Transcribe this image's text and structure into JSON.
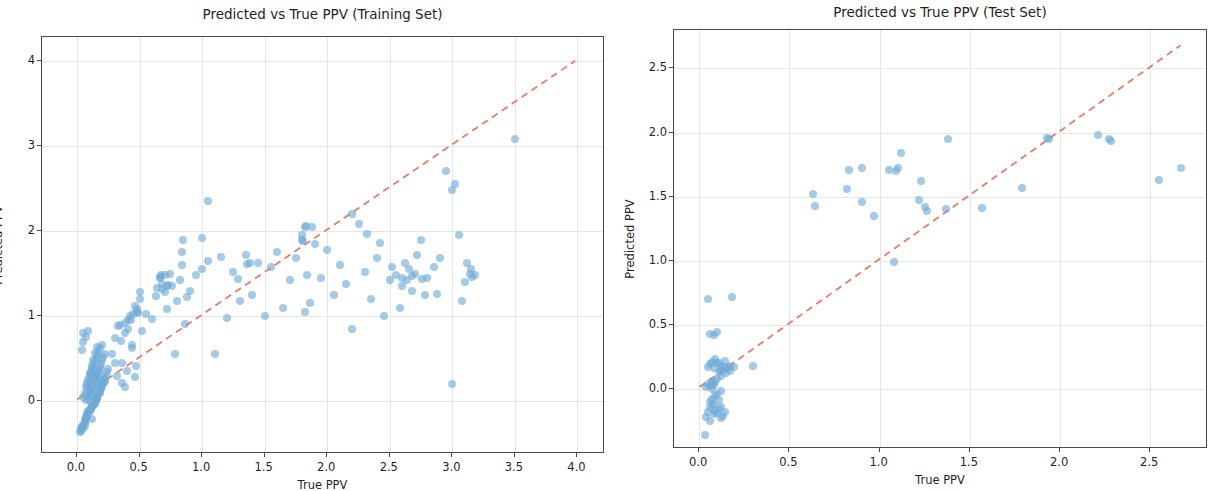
{
  "figure": {
    "background_color": "#ffffff",
    "point_color": "#6ea9d7",
    "point_opacity": 0.62,
    "reference_line_color": "#e8705a",
    "grid_color": "#e4e7ea",
    "axis_color": "#4a4a4a"
  },
  "chart_data": [
    {
      "id": "training",
      "type": "scatter",
      "title": "Predicted vs True PPV (Training Set)",
      "xlabel": "True PPV",
      "ylabel": "Predicted PPV",
      "xlim": [
        -0.28,
        4.22
      ],
      "ylim": [
        -0.62,
        4.28
      ],
      "xticks": [
        0.0,
        0.5,
        1.0,
        1.5,
        2.0,
        2.5,
        3.0,
        3.5,
        4.0
      ],
      "xticklabels": [
        "0.0",
        "0.5",
        "1.0",
        "1.5",
        "2.0",
        "2.5",
        "3.0",
        "3.5",
        "4.0"
      ],
      "yticks": [
        0,
        1,
        2,
        3,
        4
      ],
      "yticklabels": [
        "0",
        "1",
        "2",
        "3",
        "4"
      ],
      "grid": true,
      "legend": null,
      "reference_line": {
        "label": "y = x",
        "from": [
          0.0,
          0.0
        ],
        "to": [
          4.0,
          4.0
        ],
        "style": "dashed",
        "color": "#e8705a"
      },
      "x": [
        0.03,
        0.04,
        0.05,
        0.05,
        0.06,
        0.06,
        0.07,
        0.07,
        0.07,
        0.08,
        0.08,
        0.08,
        0.09,
        0.09,
        0.09,
        0.1,
        0.1,
        0.1,
        0.1,
        0.11,
        0.11,
        0.11,
        0.12,
        0.12,
        0.12,
        0.12,
        0.13,
        0.13,
        0.13,
        0.14,
        0.14,
        0.14,
        0.15,
        0.15,
        0.15,
        0.16,
        0.16,
        0.16,
        0.17,
        0.17,
        0.17,
        0.18,
        0.18,
        0.18,
        0.19,
        0.19,
        0.2,
        0.2,
        0.2,
        0.21,
        0.21,
        0.22,
        0.22,
        0.23,
        0.24,
        0.25,
        0.05,
        0.06,
        0.07,
        0.08,
        0.08,
        0.09,
        0.1,
        0.1,
        0.11,
        0.11,
        0.12,
        0.12,
        0.13,
        0.13,
        0.14,
        0.14,
        0.15,
        0.16,
        0.16,
        0.17,
        0.18,
        0.19,
        0.2,
        0.22,
        0.04,
        0.06,
        0.08,
        0.09,
        0.11,
        0.13,
        0.15,
        0.17,
        0.19,
        0.21,
        0.05,
        0.07,
        0.09,
        0.12,
        0.14,
        0.16,
        0.18,
        0.06,
        0.1,
        0.14,
        0.02,
        0.03,
        0.04,
        0.05,
        0.28,
        0.3,
        0.32,
        0.34,
        0.36,
        0.38,
        0.4,
        0.42,
        0.44,
        0.46,
        0.48,
        0.5,
        0.35,
        0.38,
        0.41,
        0.44,
        0.47,
        0.3,
        0.33,
        0.43,
        0.46,
        0.49,
        0.52,
        0.55,
        0.6,
        0.63,
        0.66,
        0.68,
        0.7,
        0.72,
        0.74,
        0.76,
        0.78,
        0.8,
        0.82,
        0.84,
        0.86,
        0.88,
        0.9,
        0.95,
        1.0,
        1.05,
        1.1,
        1.15,
        1.2,
        1.25,
        1.3,
        1.35,
        1.4,
        1.45,
        1.5,
        1.55,
        1.6,
        1.65,
        1.7,
        1.75,
        1.8,
        1.82,
        1.84,
        1.86,
        1.88,
        1.9,
        1.95,
        2.0,
        2.05,
        2.1,
        2.15,
        2.2,
        2.25,
        2.3,
        2.35,
        2.4,
        2.45,
        2.5,
        2.52,
        2.55,
        2.58,
        2.6,
        2.62,
        2.65,
        2.68,
        2.7,
        2.72,
        2.75,
        2.78,
        2.8,
        2.85,
        2.9,
        2.95,
        3.0,
        3.02,
        3.05,
        3.08,
        3.1,
        3.12,
        3.15,
        3.18,
        3.5,
        3.0,
        1.0,
        1.05,
        0.85,
        0.84,
        0.7,
        0.68,
        0.5,
        0.48,
        0.36,
        0.45,
        0.38,
        0.41,
        2.2,
        2.42,
        2.32,
        1.82,
        1.83,
        1.36,
        1.38,
        1.29,
        0.66,
        0.67,
        0.64,
        0.72,
        0.73,
        1.8,
        1.81,
        2.6,
        2.64,
        2.68,
        2.76,
        2.88,
        3.14,
        3.16
      ],
      "y": [
        -0.35,
        -0.3,
        -0.28,
        0.05,
        -0.22,
        0.1,
        -0.18,
        0.02,
        0.18,
        -0.15,
        0.08,
        0.22,
        -0.12,
        0.04,
        0.26,
        -0.1,
        0.0,
        0.14,
        0.3,
        -0.08,
        0.12,
        0.34,
        -0.06,
        0.06,
        0.2,
        0.38,
        -0.04,
        0.16,
        0.42,
        -0.02,
        0.24,
        0.46,
        0.0,
        0.28,
        0.5,
        0.04,
        0.32,
        0.54,
        0.08,
        0.36,
        0.58,
        0.1,
        0.4,
        0.62,
        0.14,
        0.44,
        0.18,
        0.48,
        0.66,
        0.22,
        0.52,
        0.26,
        0.56,
        0.3,
        0.34,
        0.38,
        -0.32,
        -0.26,
        -0.2,
        -0.16,
        0.16,
        -0.14,
        -0.11,
        0.24,
        -0.09,
        0.32,
        -0.07,
        0.41,
        -0.05,
        0.49,
        -0.03,
        0.57,
        0.01,
        0.03,
        0.64,
        0.07,
        0.11,
        0.15,
        0.19,
        0.23,
        -0.33,
        -0.24,
        -0.19,
        -0.13,
        0.09,
        0.13,
        0.17,
        0.21,
        0.25,
        0.29,
        0.7,
        0.76,
        0.82,
        -0.21,
        0.27,
        0.31,
        0.35,
        -0.29,
        0.33,
        0.37,
        -0.36,
        -0.31,
        0.6,
        0.8,
        0.56,
        0.45,
        0.3,
        0.9,
        0.22,
        0.17,
        0.35,
        1.0,
        0.62,
        0.28,
        1.05,
        1.2,
        0.71,
        0.92,
        0.85,
        0.66,
        0.41,
        0.74,
        0.88,
        0.95,
        1.12,
        1.04,
        0.82,
        1.02,
        0.97,
        1.24,
        1.45,
        1.38,
        1.28,
        1.08,
        1.5,
        1.35,
        0.55,
        1.18,
        1.42,
        1.6,
        0.91,
        1.22,
        1.3,
        1.48,
        1.55,
        1.65,
        0.55,
        1.7,
        0.98,
        1.52,
        1.18,
        1.72,
        1.25,
        1.62,
        1.0,
        1.58,
        1.75,
        1.1,
        1.42,
        1.68,
        1.95,
        1.05,
        1.48,
        1.15,
        2.05,
        1.85,
        1.45,
        1.78,
        1.25,
        1.6,
        1.38,
        0.85,
        2.08,
        1.52,
        1.2,
        1.68,
        1.0,
        1.42,
        1.58,
        1.48,
        1.1,
        1.35,
        1.62,
        1.55,
        1.3,
        1.5,
        1.72,
        1.9,
        1.25,
        1.45,
        1.58,
        1.68,
        2.7,
        2.48,
        2.55,
        1.95,
        1.18,
        1.4,
        1.62,
        1.55,
        1.48,
        3.08,
        0.2,
        1.92,
        2.35,
        1.9,
        1.75,
        1.48,
        1.32,
        1.28,
        1.08,
        0.45,
        1.02,
        0.8,
        0.95,
        2.2,
        1.86,
        1.96,
        2.05,
        2.06,
        1.61,
        1.62,
        1.44,
        1.46,
        1.48,
        1.33,
        1.35,
        1.37,
        1.9,
        1.88,
        1.45,
        1.42,
        1.47,
        1.44,
        1.26,
        1.5,
        1.46
      ]
    },
    {
      "id": "test",
      "type": "scatter",
      "title": "Predicted vs True PPV (Test Set)",
      "xlabel": "True PPV",
      "ylabel": "Predicted PPV",
      "xlim": [
        -0.14,
        2.82
      ],
      "ylim": [
        -0.47,
        2.8
      ],
      "xticks": [
        0.0,
        0.5,
        1.0,
        1.5,
        2.0,
        2.5
      ],
      "xticklabels": [
        "0.0",
        "0.5",
        "1.0",
        "1.5",
        "2.0",
        "2.5"
      ],
      "yticks": [
        0.0,
        0.5,
        1.0,
        1.5,
        2.0,
        2.5
      ],
      "yticklabels": [
        "0.0",
        "0.5",
        "1.0",
        "1.5",
        "2.0",
        "2.5"
      ],
      "grid": true,
      "legend": null,
      "reference_line": {
        "label": "y = x",
        "from": [
          0.0,
          0.0
        ],
        "to": [
          2.68,
          2.68
        ],
        "style": "dashed",
        "color": "#e8705a"
      },
      "x": [
        0.03,
        0.04,
        0.04,
        0.05,
        0.05,
        0.05,
        0.06,
        0.06,
        0.06,
        0.07,
        0.07,
        0.07,
        0.07,
        0.08,
        0.08,
        0.08,
        0.09,
        0.09,
        0.09,
        0.1,
        0.1,
        0.1,
        0.11,
        0.11,
        0.12,
        0.12,
        0.12,
        0.13,
        0.13,
        0.14,
        0.14,
        0.15,
        0.05,
        0.06,
        0.07,
        0.08,
        0.09,
        0.1,
        0.11,
        0.12,
        0.06,
        0.08,
        0.1,
        0.12,
        0.14,
        0.16,
        0.18,
        0.06,
        0.12,
        0.19,
        0.11,
        0.17,
        0.07,
        0.3,
        0.17,
        1.08,
        0.63,
        0.64,
        0.82,
        0.83,
        0.9,
        0.9,
        0.97,
        1.05,
        1.09,
        1.1,
        1.12,
        1.22,
        1.23,
        1.25,
        1.26,
        1.37,
        1.38,
        1.57,
        1.79,
        1.93,
        1.94,
        2.21,
        2.27,
        2.28,
        2.55,
        2.67
      ],
      "y": [
        -0.36,
        -0.22,
        0.01,
        -0.18,
        0.04,
        0.17,
        -0.15,
        0.02,
        0.19,
        -0.13,
        0.0,
        0.06,
        0.21,
        -0.2,
        0.03,
        0.16,
        -0.17,
        0.05,
        0.23,
        -0.19,
        0.08,
        0.2,
        -0.16,
        0.13,
        -0.14,
        0.1,
        0.18,
        -0.21,
        0.15,
        -0.18,
        0.22,
        0.12,
        0.7,
        -0.1,
        -0.08,
        -0.12,
        -0.06,
        -0.04,
        -0.09,
        -0.02,
        0.43,
        0.42,
        0.44,
        0.15,
        0.17,
        0.16,
        0.72,
        -0.25,
        -0.23,
        0.17,
        0.2,
        0.18,
        0.04,
        0.18,
        0.14,
        0.99,
        1.52,
        1.43,
        1.56,
        1.71,
        1.46,
        1.72,
        1.35,
        1.71,
        1.7,
        1.72,
        1.84,
        1.47,
        1.62,
        1.42,
        1.39,
        1.4,
        1.95,
        1.41,
        1.57,
        1.96,
        1.95,
        1.98,
        1.95,
        1.93,
        1.63,
        1.72
      ]
    }
  ]
}
